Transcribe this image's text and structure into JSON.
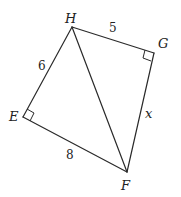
{
  "diagram": {
    "type": "geometry-quadrilateral",
    "vertices": {
      "H": {
        "label": "H",
        "x": 72,
        "y": 27
      },
      "G": {
        "label": "G",
        "x": 154,
        "y": 53
      },
      "E": {
        "label": "E",
        "x": 23,
        "y": 117
      },
      "F": {
        "label": "F",
        "x": 127,
        "y": 172
      }
    },
    "edges": [
      {
        "from": "H",
        "to": "G",
        "label": "5"
      },
      {
        "from": "H",
        "to": "E",
        "label": "6"
      },
      {
        "from": "E",
        "to": "F",
        "label": "8"
      },
      {
        "from": "G",
        "to": "F",
        "label": "x"
      },
      {
        "from": "H",
        "to": "F",
        "label": ""
      }
    ],
    "right_angles": [
      "E",
      "G"
    ],
    "labels": {
      "H": "H",
      "G": "G",
      "E": "E",
      "F": "F",
      "HG": "5",
      "HE": "6",
      "EF": "8",
      "GF": "x"
    }
  }
}
